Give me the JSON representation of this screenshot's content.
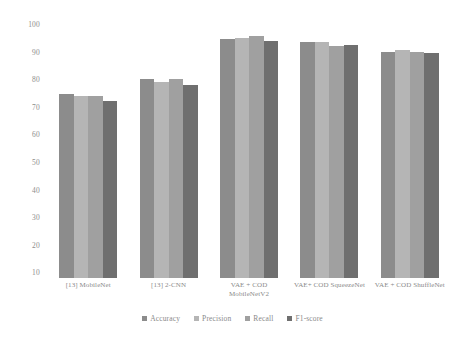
{
  "chart_data": {
    "type": "bar",
    "title": "",
    "subtitle": "",
    "xlabel": "",
    "ylabel": "",
    "ylim": [
      8,
      100
    ],
    "yticks": [
      10,
      20,
      30,
      40,
      50,
      60,
      70,
      80,
      90,
      100
    ],
    "grid": false,
    "legend_position": "bottom",
    "categories": [
      "[13] MobileNet",
      "[13] 2-CNN",
      "VAE + COD MobileNetV2",
      "VAE+ COD SqueezeNet",
      "VAE + COD ShuffleNet"
    ],
    "series": [
      {
        "name": "Accuracy",
        "color": "#8c8c8c",
        "values": [
          74.5,
          80.0,
          94.5,
          93.5,
          90.0
        ]
      },
      {
        "name": "Precision",
        "color": "#b5b5b5",
        "values": [
          74.0,
          79.0,
          95.0,
          93.5,
          90.5
        ]
      },
      {
        "name": "Recall",
        "color": "#a0a0a0",
        "values": [
          74.0,
          80.0,
          95.5,
          92.0,
          90.0
        ]
      },
      {
        "name": "F1-score",
        "color": "#6f6f6f",
        "values": [
          72.0,
          78.0,
          94.0,
          92.5,
          89.5
        ]
      }
    ]
  },
  "axis": {
    "y_tick_labels": [
      "100",
      "90",
      "80",
      "70",
      "60",
      "50",
      "40",
      "30",
      "20",
      "10"
    ]
  },
  "legend": {
    "items": [
      {
        "label": "Accuracy"
      },
      {
        "label": "Precision"
      },
      {
        "label": "Recall"
      },
      {
        "label": "F1-score"
      }
    ]
  }
}
